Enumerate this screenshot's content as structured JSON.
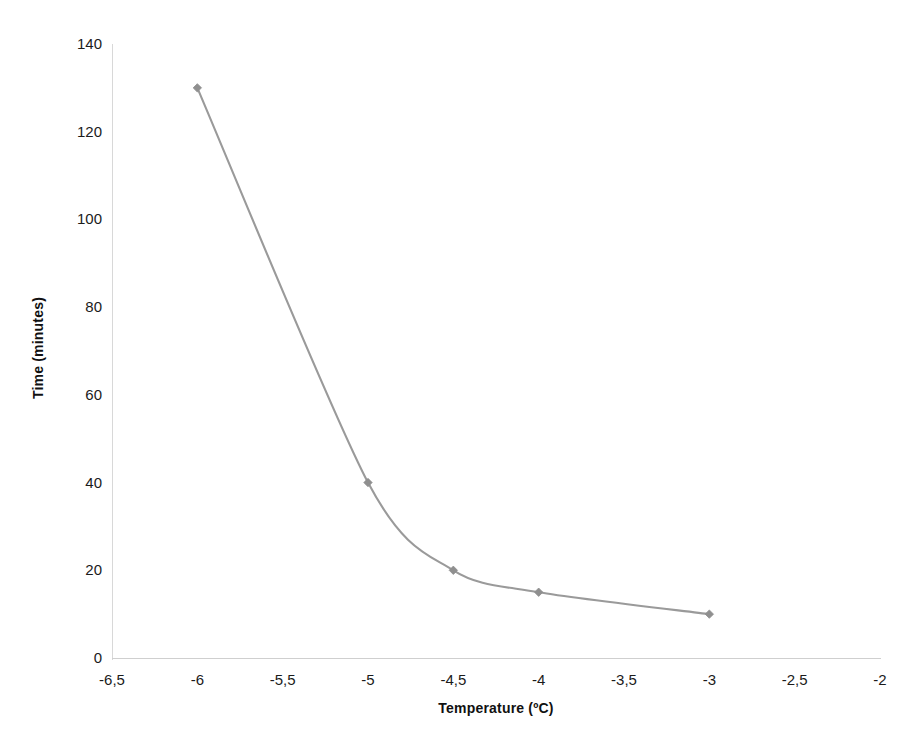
{
  "chart_data": {
    "type": "line",
    "title": "",
    "subtitle": "",
    "xlabel": "Temperature (ºC)",
    "ylabel": "Time (minutes)",
    "xlim": [
      -6.5,
      -2
    ],
    "ylim": [
      0,
      140
    ],
    "grid": false,
    "legend": "none",
    "x": [
      -6,
      -5,
      -4.5,
      -4,
      -3
    ],
    "values": [
      130,
      40,
      20,
      15,
      10
    ],
    "series": [
      {
        "name": "Time (minutes)",
        "x": [
          -6,
          -5,
          -4.5,
          -4,
          -3
        ],
        "values": [
          130,
          40,
          20,
          15,
          10
        ],
        "color": "#9a9a9a",
        "marker": "diamond",
        "smoothed": true
      }
    ],
    "xtick_labels": [
      "-6,5",
      "-6",
      "-5,5",
      "-5",
      "-4,5",
      "-4",
      "-3,5",
      "-3",
      "-2,5",
      "-2"
    ],
    "xtick_values": [
      -6.5,
      -6,
      -5.5,
      -5,
      -4.5,
      -4,
      -3.5,
      -3,
      -2.5,
      -2
    ],
    "ytick_labels": [
      "0",
      "20",
      "40",
      "60",
      "80",
      "100",
      "120",
      "140"
    ],
    "ytick_values": [
      0,
      20,
      40,
      60,
      80,
      100,
      120,
      140
    ],
    "annotations": []
  },
  "style": {
    "background": "#ffffff",
    "series_color": "#9a9a9a",
    "marker_color": "#8f8f8f",
    "axis_color": "#d4d4d4",
    "text_color": "#1b1b1b"
  }
}
